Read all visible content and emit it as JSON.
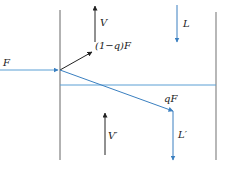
{
  "diagram": {
    "labels": {
      "F": "F",
      "one_minus_q_F": "(1−q)F",
      "V": "V",
      "L": "L",
      "qF": "qF",
      "V_prime": "V′",
      "L_prime": "L′"
    },
    "colors": {
      "black_line": "#555555",
      "blue_line": "#5a9fd4",
      "arrow_black": "#222222",
      "arrow_blue": "#3a7fc0"
    }
  }
}
